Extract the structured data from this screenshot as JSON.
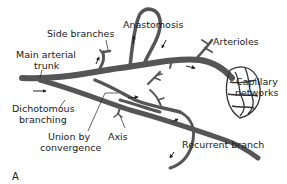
{
  "diagram": {
    "panel_letter": "A",
    "colors": {
      "vessel": "#555555",
      "vessel_outline": "#333333",
      "text": "#1a1a1a",
      "background": "#ffffff"
    },
    "labels": {
      "side_branches": "Side branches",
      "main_trunk_line1": "Main arterial",
      "main_trunk_line2": "trunk",
      "anastomosis": "Anastomosis",
      "arterioles": "Arterioles",
      "capillary_line1": "Capillary",
      "capillary_line2": "networks",
      "dichotomous_line1": "Dichotomous",
      "dichotomous_line2": "branching",
      "union_line1": "Union by",
      "union_line2": "convergence",
      "axis": "Axis",
      "recurrent": "Recurrent branch"
    }
  }
}
